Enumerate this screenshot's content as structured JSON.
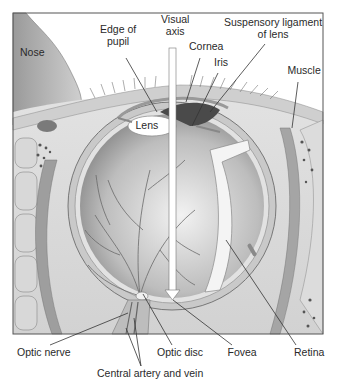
{
  "diagram": {
    "colors": {
      "background": "#ffffff",
      "frame": "#555555",
      "tissue_light": "#e6e6e6",
      "tissue_mid": "#bdbdbd",
      "tissue_dark": "#7a7a7a",
      "leader": "#333333",
      "axis_arrow": "#ffffff"
    },
    "labels": [
      {
        "id": "nose",
        "text": "Nose",
        "x": 20,
        "y": 52,
        "align": "left"
      },
      {
        "id": "edge-of-pupil",
        "text": "Edge of\npupil",
        "x": 118,
        "y": 35
      },
      {
        "id": "visual-axis",
        "text": "Visual\naxis",
        "x": 175,
        "y": 25
      },
      {
        "id": "cornea",
        "text": "Cornea",
        "x": 206,
        "y": 46
      },
      {
        "id": "iris",
        "text": "Iris",
        "x": 221,
        "y": 62
      },
      {
        "id": "suspensory-ligament",
        "text": "Suspensory ligament\nof lens",
        "x": 273,
        "y": 28
      },
      {
        "id": "muscle",
        "text": "Muscle",
        "x": 304,
        "y": 70
      },
      {
        "id": "lens",
        "text": "Lens",
        "x": 147,
        "y": 125
      },
      {
        "id": "optic-nerve",
        "text": "Optic nerve",
        "x": 44,
        "y": 352
      },
      {
        "id": "optic-disc",
        "text": "Optic disc",
        "x": 180,
        "y": 352
      },
      {
        "id": "fovea",
        "text": "Fovea",
        "x": 242,
        "y": 352
      },
      {
        "id": "retina",
        "text": "Retina",
        "x": 309,
        "y": 352
      },
      {
        "id": "central-artery-vein",
        "text": "Central artery and vein",
        "x": 150,
        "y": 373
      }
    ],
    "leaders": [
      {
        "id": "edge-of-pupil",
        "x1": 126,
        "y1": 58,
        "x2": 157,
        "y2": 112
      },
      {
        "id": "cornea",
        "x1": 200,
        "y1": 58,
        "x2": 186,
        "y2": 102
      },
      {
        "id": "iris",
        "x1": 218,
        "y1": 73,
        "x2": 192,
        "y2": 126
      },
      {
        "id": "suspensory-ligament",
        "x1": 265,
        "y1": 44,
        "x2": 210,
        "y2": 112
      },
      {
        "id": "muscle",
        "x1": 298,
        "y1": 82,
        "x2": 292,
        "y2": 128
      },
      {
        "id": "optic-nerve",
        "x1": 50,
        "y1": 345,
        "x2": 128,
        "y2": 313
      },
      {
        "id": "optic-disc",
        "x1": 172,
        "y1": 345,
        "x2": 143,
        "y2": 294
      },
      {
        "id": "fovea",
        "x1": 232,
        "y1": 345,
        "x2": 173,
        "y2": 300
      },
      {
        "id": "retina",
        "x1": 296,
        "y1": 345,
        "x2": 226,
        "y2": 240
      },
      {
        "id": "central-artery-vein-a",
        "x1": 141,
        "y1": 366,
        "x2": 126,
        "y2": 328
      },
      {
        "id": "central-artery-vein-b",
        "x1": 141,
        "y1": 366,
        "x2": 134,
        "y2": 318
      }
    ]
  }
}
